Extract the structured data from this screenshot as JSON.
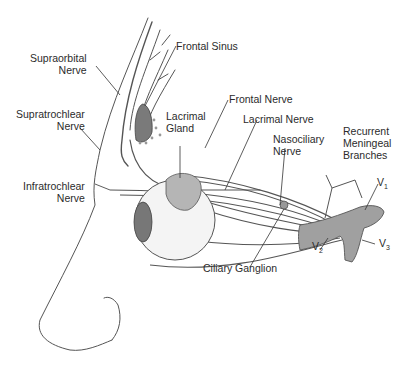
{
  "figure": {
    "colors": {
      "line": "#555555",
      "fill": "#9a9a9a",
      "dark": "#6e6e6e",
      "text": "#2b2b2b"
    }
  },
  "labels": {
    "supraorbital": [
      "Supraorbital",
      "Nerve"
    ],
    "frontal_sinus": "Frontal Sinus",
    "supratrochlear": [
      "Supratrochlear",
      "Nerve"
    ],
    "lacrimal_gland": [
      "Lacrimal",
      "Gland"
    ],
    "frontal_nerve": "Frontal Nerve",
    "lacrimal_nerve": "Lacrimal Nerve",
    "nasociliary": [
      "Nasociliary",
      "Nerve"
    ],
    "recurrent": [
      "Recurrent",
      "Meningeal",
      "Branches"
    ],
    "infratrochlear": [
      "Infratrochlear",
      "Nerve"
    ],
    "ciliary_ganglion": "Ciliary Ganglion",
    "v1": {
      "base": "V",
      "sub": "1"
    },
    "v2": {
      "base": "V",
      "sub": "2"
    },
    "v3": {
      "base": "V",
      "sub": "3"
    }
  }
}
